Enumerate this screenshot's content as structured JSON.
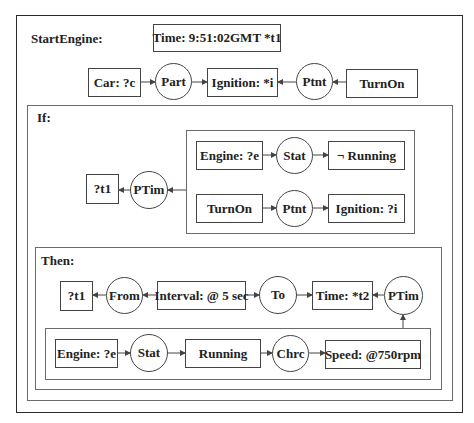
{
  "diagram": {
    "title": "StartEngine:",
    "time_concept": "Time: 9:51:02GMT *t1",
    "top_row": {
      "car": "Car: ?c",
      "part": "Part",
      "ignition": "Ignition: *i",
      "ptnt": "Ptnt",
      "turnon": "TurnOn"
    },
    "if_context": {
      "label": "If:",
      "t1": "?t1",
      "ptim": "PTim",
      "row1": {
        "engine": "Engine: ?e",
        "stat": "Stat",
        "not_running": "¬ Running"
      },
      "row2": {
        "turnon": "TurnOn",
        "ptnt": "Ptnt",
        "ignition": "Ignition: ?i"
      },
      "then_context": {
        "label": "Then:",
        "row": {
          "t1": "?t1",
          "from": "From",
          "interval": "Interval: @ 5 sec",
          "to": "To",
          "time": "Time: *t2",
          "ptim": "PTim"
        },
        "inner": {
          "engine": "Engine: ?e",
          "stat": "Stat",
          "running": "Running",
          "chrc": "Chrc",
          "speed": "Speed: @750rpm"
        }
      }
    }
  },
  "colors": {
    "line": "#444444",
    "outer_border": "#2a2a2a",
    "context_border": "#6a6a6a",
    "text": "#222222"
  }
}
